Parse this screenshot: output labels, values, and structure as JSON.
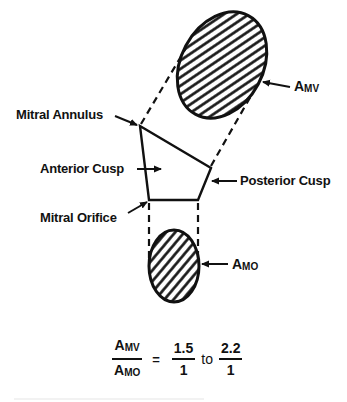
{
  "diagram": {
    "labels": {
      "mitral_annulus": "Mitral Annulus",
      "anterior_cusp": "Anterior Cusp",
      "posterior_cusp": "Posterior Cusp",
      "mitral_orifice": "Mitral Orifice",
      "a_mv": {
        "base": "A",
        "sub": "MV"
      },
      "a_mo": {
        "base": "A",
        "sub": "MO"
      }
    },
    "shapes": {
      "valve_area_ellipse": {
        "cx": 222,
        "cy": 65,
        "rx": 42,
        "ry": 56,
        "rotate": 28,
        "fill": "diagonal-hatch"
      },
      "orifice_area_ellipse": {
        "cx": 174,
        "cy": 266,
        "rx": 25,
        "ry": 36,
        "fill": "diagonal-hatch"
      },
      "leaflet_polygon": [
        [
          140,
          126
        ],
        [
          211,
          168
        ],
        [
          198,
          200
        ],
        [
          149,
          200
        ]
      ]
    },
    "formula": {
      "numerator": {
        "base": "A",
        "sub": "MV"
      },
      "denominator": {
        "base": "A",
        "sub": "MO"
      },
      "equals": "=",
      "low": {
        "num": "1.5",
        "den": "1"
      },
      "connector": "to",
      "high": {
        "num": "2.2",
        "den": "1"
      }
    },
    "colors": {
      "ink": "#111111",
      "background": "#ffffff"
    }
  }
}
